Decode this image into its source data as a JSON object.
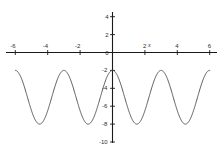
{
  "figure": {
    "background_color": "#ffffff",
    "axis_color": "#1a1a1a",
    "curve_color": "#4a4a4a",
    "label_color": "#2b2b2b"
  },
  "chart_data": {
    "type": "line",
    "title": "",
    "subtitle": "",
    "xlabel": "x",
    "ylabel": "",
    "xlim": [
      -6.5,
      6.5
    ],
    "ylim": [
      -10,
      5
    ],
    "grid": false,
    "legend": null,
    "axes_style": "cartesian-cross",
    "x_ticks": [
      -6,
      -4,
      -2,
      2,
      4,
      6
    ],
    "x_tick_labels": [
      "-6",
      "-4",
      "-2",
      "2",
      "4",
      "6"
    ],
    "y_ticks": [
      4,
      2,
      0,
      -2,
      -4,
      -6,
      -8,
      -10
    ],
    "y_tick_labels": [
      "4",
      "2",
      "0",
      "-2",
      "-4",
      "-6",
      "-8",
      "-10"
    ],
    "origin_label": "0",
    "series": [
      {
        "name": "curve",
        "equation": "y = 3*cos(2*pi*x/3) - 5",
        "amplitude": 3,
        "midline": -5,
        "period": 3,
        "maximum": -2,
        "minimum": -8,
        "x_domain": [
          -6.0,
          6.0
        ],
        "maxima_x": [
          -6.0,
          -3.0,
          0.0,
          3.0,
          6.0
        ],
        "minima_x": [
          -4.5,
          -1.5,
          1.5,
          4.5
        ],
        "x": [
          -6.0,
          -5.75,
          -5.5,
          -5.25,
          -5.0,
          -4.75,
          -4.5,
          -4.25,
          -4.0,
          -3.75,
          -3.5,
          -3.25,
          -3.0,
          -2.75,
          -2.5,
          -2.25,
          -2.0,
          -1.75,
          -1.5,
          -1.25,
          -1.0,
          -0.75,
          -0.5,
          -0.25,
          0.0,
          0.25,
          0.5,
          0.75,
          1.0,
          1.25,
          1.5,
          1.75,
          2.0,
          2.25,
          2.5,
          2.75,
          3.0,
          3.25,
          3.5,
          3.75,
          4.0,
          4.25,
          4.5,
          4.75,
          5.0,
          5.25,
          5.5,
          5.75,
          6.0
        ],
        "y": [
          -2.0,
          -2.4,
          -3.5,
          -5.0,
          -6.5,
          -7.6,
          -8.0,
          -7.6,
          -6.5,
          -5.0,
          -3.5,
          -2.4,
          -2.0,
          -2.4,
          -3.5,
          -5.0,
          -6.5,
          -7.6,
          -8.0,
          -7.6,
          -6.5,
          -5.0,
          -3.5,
          -2.4,
          -2.0,
          -2.4,
          -3.5,
          -5.0,
          -6.5,
          -7.6,
          -8.0,
          -7.6,
          -6.5,
          -5.0,
          -3.5,
          -2.4,
          -2.0,
          -2.4,
          -3.5,
          -5.0,
          -6.5,
          -7.6,
          -8.0,
          -7.6,
          -6.5,
          -5.0,
          -3.5,
          -2.4,
          -2.0
        ]
      }
    ]
  }
}
